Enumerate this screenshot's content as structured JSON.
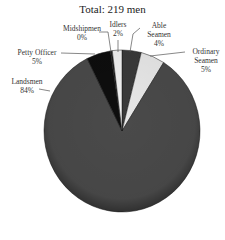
{
  "chart_data": {
    "type": "pie",
    "title": "Total: 219 men",
    "start_angle_deg": 0,
    "direction": "clockwise",
    "slices": [
      {
        "label": "Able Seamen",
        "value": 4,
        "display": "4%",
        "color": "#3a3a3a"
      },
      {
        "label": "Ordinary Seamen",
        "value": 5,
        "display": "5%",
        "color": "#e8e8e8"
      },
      {
        "label": "Landsmen",
        "value": 84,
        "display": "84%",
        "color": "#4a4a4a"
      },
      {
        "label": "Petty Officer",
        "value": 5,
        "display": "5%",
        "color": "#0e0e0e"
      },
      {
        "label": "Midshipmen",
        "value": 0,
        "display": "0%",
        "color": "#222222"
      },
      {
        "label": "Idlers",
        "value": 2,
        "display": "2%",
        "color": "#f2f2f2"
      }
    ]
  },
  "labels": {
    "able_seamen": {
      "name_line1": "Able",
      "name_line2": "Seamen",
      "pct": "4%"
    },
    "ordinary_seamen": {
      "name_line1": "Ordinary",
      "name_line2": "Seamen",
      "pct": "5%"
    },
    "landsmen": {
      "name": "Landsmen",
      "pct": "84%"
    },
    "petty_officer": {
      "name": "Petty Officer",
      "pct": "5%"
    },
    "midshipmen": {
      "name": "Midshipmen",
      "pct": "0%"
    },
    "idlers": {
      "name": "Idlers",
      "pct": "2%"
    }
  }
}
